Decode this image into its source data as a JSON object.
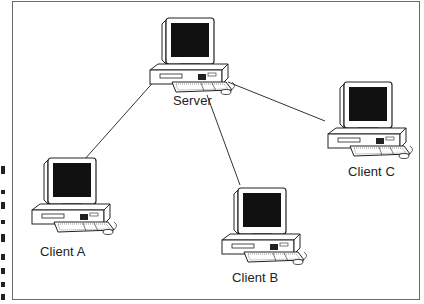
{
  "diagram": {
    "type": "network-topology",
    "frame_color": "#6a6a6a",
    "line_color": "#333333",
    "nodes": [
      {
        "id": "server",
        "label": "Server",
        "role": "server"
      },
      {
        "id": "client-a",
        "label": "Client A",
        "role": "client"
      },
      {
        "id": "client-b",
        "label": "Client B",
        "role": "client"
      },
      {
        "id": "client-c",
        "label": "Client C",
        "role": "client"
      }
    ],
    "edges": [
      {
        "from": "server",
        "to": "client-a"
      },
      {
        "from": "server",
        "to": "client-b"
      },
      {
        "from": "server",
        "to": "client-c"
      }
    ],
    "icon": "desktop-computer-icon"
  }
}
